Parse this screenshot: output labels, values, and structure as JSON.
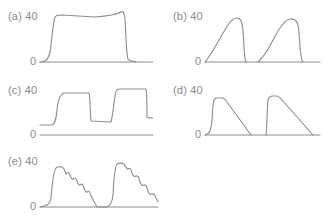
{
  "figure": {
    "panels": [
      {
        "id": "a",
        "label": "(a) 40",
        "zero": "0",
        "shape": "square pressure waveform with flat plateau"
      },
      {
        "id": "b",
        "label": "(b) 40",
        "zero": "0",
        "shape": "two ascending ramp humps"
      },
      {
        "id": "c",
        "label": "(c) 40",
        "zero": "0",
        "shape": "square waveform with elevated baseline"
      },
      {
        "id": "d",
        "label": "(d) 40",
        "zero": "0",
        "shape": "two decelerating (descending ramp) pulses"
      },
      {
        "id": "e",
        "label": "(e) 40",
        "zero": "0",
        "shape": "two pulses with oscillating/ripple descent"
      }
    ],
    "colors": {
      "line": "#8c8c8c",
      "text": "#8a8a8a",
      "background": "#ffffff"
    }
  }
}
